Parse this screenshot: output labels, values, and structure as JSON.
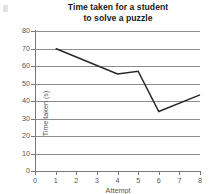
{
  "chart_data": {
    "type": "line",
    "title": "Time taken for a student to solve a puzzle",
    "title_line1": "Time taken for a student",
    "title_line2": "to solve a puzzle",
    "xlabel": "Attempt",
    "ylabel": "Time taken (s)",
    "xlim": [
      0,
      8
    ],
    "ylim": [
      0,
      80
    ],
    "xticks": [
      "0",
      "1",
      "2",
      "3",
      "4",
      "5",
      "6",
      "7",
      "8"
    ],
    "yticks": [
      "0",
      "10",
      "20",
      "30",
      "40",
      "50",
      "60",
      "70",
      "80"
    ],
    "grid": "horizontal",
    "legend": "none",
    "series": [
      {
        "name": "Time taken",
        "color": "#262626",
        "x": [
          1,
          4,
          5,
          6,
          8
        ],
        "values": [
          70,
          55.5,
          57,
          34,
          43.5
        ]
      }
    ]
  }
}
